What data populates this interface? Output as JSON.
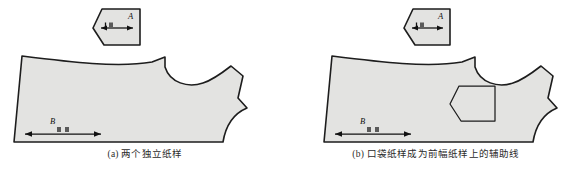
{
  "figure": {
    "background_color": "#ffffff",
    "pattern_fill_color": "#e3e3e1",
    "outline_color": "#1d1d1d",
    "width": 581,
    "height": 172
  },
  "panels": [
    {
      "id": "a",
      "caption": "(a) 两个独立纸样",
      "pocket_label": "A",
      "body_label": "B",
      "pocket_rendering": "filled-separate-piece",
      "body_rendering": "filled-piece"
    },
    {
      "id": "b",
      "caption": "(b) 口袋纸样成为前幅纸样上的辅助线",
      "pocket_label": "A",
      "body_label": "B",
      "pocket_rendering": "outline-on-body",
      "body_rendering": "filled-piece"
    }
  ]
}
